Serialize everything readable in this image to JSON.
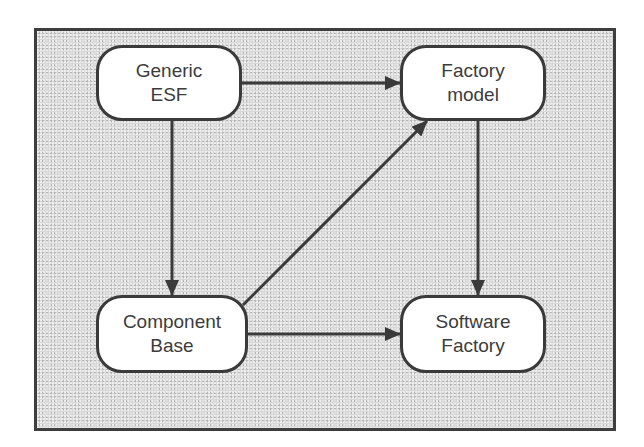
{
  "diagram": {
    "nodes": [
      {
        "id": "generic-esf",
        "lines": [
          "Generic",
          "ESF"
        ]
      },
      {
        "id": "factory-model",
        "lines": [
          "Factory",
          "model"
        ]
      },
      {
        "id": "component-base",
        "lines": [
          "Component",
          "Base"
        ]
      },
      {
        "id": "software-factory",
        "lines": [
          "Software",
          "Factory"
        ]
      }
    ],
    "edges": [
      {
        "from": "generic-esf",
        "to": "factory-model"
      },
      {
        "from": "generic-esf",
        "to": "component-base"
      },
      {
        "from": "factory-model",
        "to": "software-factory"
      },
      {
        "from": "component-base",
        "to": "factory-model"
      },
      {
        "from": "component-base",
        "to": "software-factory"
      }
    ],
    "colors": {
      "background": "#d8d8d8",
      "node_fill": "#ffffff",
      "stroke": "#3a3a3a",
      "text": "#3c3c3c"
    }
  }
}
